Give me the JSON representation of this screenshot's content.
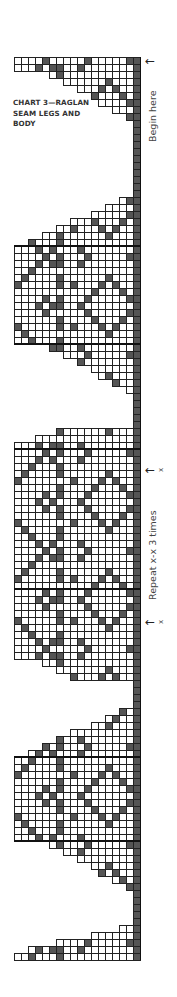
{
  "title": {
    "lines": [
      "CHART 3—RAGLAN",
      "SEAM LEGS AND",
      "BODY"
    ]
  },
  "labels": {
    "begin_here": "Begin here",
    "repeat": "Repeat x-x 3 times",
    "x_mark": "x",
    "arrow": "←"
  },
  "colors": {
    "dark_cell": "#555555",
    "grid_line": "#222222",
    "text": "#444444",
    "background": "#ffffff"
  },
  "grid": {
    "origin_x": 14,
    "origin_y": 57,
    "cell_w": 7,
    "cell_h": 7,
    "cols": 18,
    "rows": 129
  },
  "markers": {
    "begin_here_y": 61,
    "repeat_top_y": 470,
    "repeat_bottom_y": 622
  },
  "regions": [
    {
      "name": "top-band",
      "row_start": 0,
      "row_end": 2,
      "profile": "flat"
    },
    {
      "name": "top-taper",
      "row_start": 2,
      "row_end": 9,
      "profile": "taper-down"
    },
    {
      "name": "seam-gap-1",
      "row_start": 9,
      "row_end": 20,
      "profile": "seam"
    },
    {
      "name": "motif-1-rise",
      "row_start": 20,
      "row_end": 27,
      "profile": "taper-up"
    },
    {
      "name": "motif-1",
      "row_start": 27,
      "row_end": 41,
      "profile": "full"
    },
    {
      "name": "motif-1-fall",
      "row_start": 41,
      "row_end": 48,
      "profile": "taper-down"
    },
    {
      "name": "seam-gap-2",
      "row_start": 48,
      "row_end": 53,
      "profile": "seam"
    },
    {
      "name": "motif-2-rise",
      "row_start": 53,
      "row_end": 56,
      "profile": "taper-up-short"
    },
    {
      "name": "repeat-block",
      "row_start": 56,
      "row_end": 86,
      "profile": "full"
    },
    {
      "name": "motif-3-fall",
      "row_start": 86,
      "row_end": 89,
      "profile": "taper-down-short"
    },
    {
      "name": "seam-gap-3",
      "row_start": 89,
      "row_end": 93,
      "profile": "seam"
    },
    {
      "name": "motif-3-rise",
      "row_start": 93,
      "row_end": 100,
      "profile": "taper-up"
    },
    {
      "name": "motif-3",
      "row_start": 100,
      "row_end": 112,
      "profile": "full"
    },
    {
      "name": "motif-3-fall2",
      "row_start": 112,
      "row_end": 119,
      "profile": "taper-down"
    },
    {
      "name": "seam-gap-4",
      "row_start": 119,
      "row_end": 124,
      "profile": "seam"
    },
    {
      "name": "bottom-taper",
      "row_start": 124,
      "row_end": 128,
      "profile": "taper-up"
    },
    {
      "name": "bottom-band",
      "row_start": 128,
      "row_end": 129,
      "profile": "flat"
    }
  ],
  "heavy_lines": {
    "horizontal_rows": [
      27,
      41,
      56,
      76,
      100,
      112
    ],
    "vertical_cols": [
      9
    ]
  }
}
